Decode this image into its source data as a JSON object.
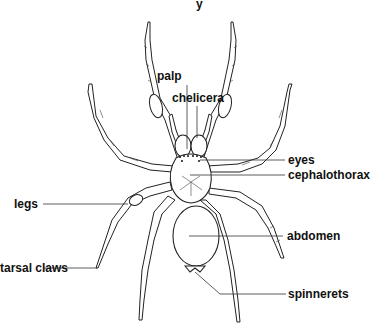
{
  "diagram": {
    "title_fragment": "y",
    "labels": {
      "palp": "palp",
      "chelicera": "chelicera",
      "eyes": "eyes",
      "cephalothorax": "cephalothorax",
      "legs": "legs",
      "abdomen": "abdomen",
      "tarsal_claws": "tarsal claws",
      "spinnerets": "spinnerets"
    }
  }
}
